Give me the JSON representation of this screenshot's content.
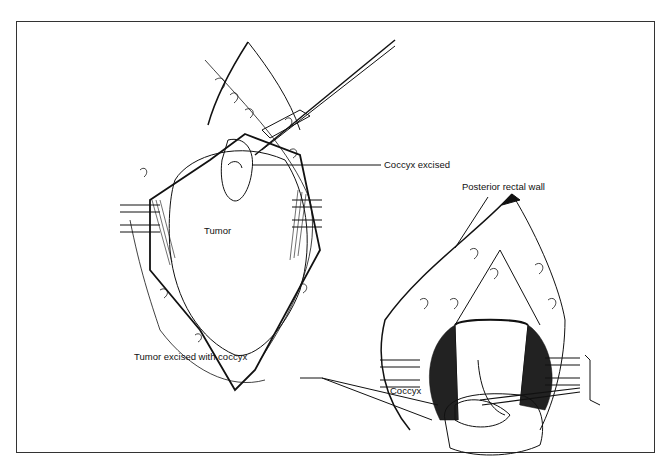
{
  "figure": {
    "labels": {
      "coccyx_excised": "Coccyx excised",
      "posterior_rectal_wall": "Posterior rectal wall",
      "tumor": "Tumor",
      "tumor_excised_with_coccyx": "Tumor excised with coccyx",
      "coccyx": "Coccyx"
    },
    "panels": [
      {
        "name": "left-panel",
        "description": "Tumor exposed with coccyx excised, retractors in place"
      },
      {
        "name": "right-panel",
        "description": "Tumor excised with coccyx, posterior rectal wall exposed"
      }
    ],
    "colors": {
      "line": "#111111",
      "background": "#ffffff",
      "frame": "#333333"
    }
  }
}
